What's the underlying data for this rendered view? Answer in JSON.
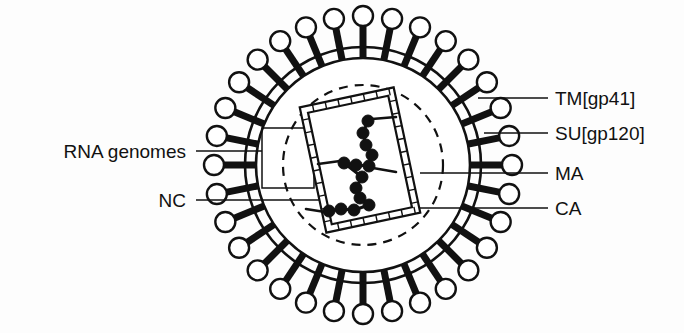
{
  "figure": {
    "kind": "hiv-virion-cross-section-diagram",
    "background_color": "#fdfdfd",
    "stroke_color": "#111111",
    "fill_color": "#ffffff"
  },
  "geometry": {
    "center_x": 363,
    "center_y": 165,
    "envelope_outer_radius": 118,
    "envelope_inner_radius": 107,
    "matrix_dashed_radius": 80,
    "spike_count": 32,
    "spike_bar_length": 22,
    "spike_head_radius": 10,
    "capsid_rotation_deg": -12,
    "capsid_x": 312,
    "capsid_y": 96,
    "capsid_width": 96,
    "capsid_height": 128,
    "capsid_wall_thickness": 7
  },
  "labels": {
    "right": [
      {
        "id": "tm",
        "text": "TM[gp41]",
        "text_x": 555,
        "text_y": 105,
        "line_x1": 478,
        "line_y1": 98,
        "line_x2": 548,
        "line_y2": 98
      },
      {
        "id": "su",
        "text": "SU[gp120]",
        "text_x": 555,
        "text_y": 140,
        "line_x1": 484,
        "line_y1": 133,
        "line_x2": 548,
        "line_y2": 133
      },
      {
        "id": "ma",
        "text": "MA",
        "text_x": 555,
        "text_y": 180,
        "line_x1": 420,
        "line_y1": 173,
        "line_x2": 548,
        "line_y2": 173
      },
      {
        "id": "ca",
        "text": "CA",
        "text_x": 555,
        "text_y": 215,
        "line_x1": 395,
        "line_y1": 208,
        "line_x2": 548,
        "line_y2": 208
      }
    ],
    "left": [
      {
        "id": "rna",
        "text": "RNA genomes",
        "text_x": 186,
        "text_y": 158,
        "line_x1": 196,
        "line_y1": 151,
        "line_x2": 262,
        "line_y2": 151
      },
      {
        "id": "nc",
        "text": "NC",
        "text_x": 186,
        "text_y": 207,
        "line_x1": 196,
        "line_y1": 200,
        "line_x2": 330,
        "line_y2": 200
      }
    ]
  },
  "rna_bracket": {
    "x": 262,
    "y": 128,
    "width": 52,
    "height": 60
  },
  "nucleocapsid_beads": [
    {
      "cx": 368,
      "cy": 121,
      "r": 6
    },
    {
      "cx": 363,
      "cy": 133,
      "r": 6
    },
    {
      "cx": 366,
      "cy": 145,
      "r": 6
    },
    {
      "cx": 372,
      "cy": 155,
      "r": 6
    },
    {
      "cx": 369,
      "cy": 166,
      "r": 6
    },
    {
      "cx": 356,
      "cy": 165,
      "r": 6
    },
    {
      "cx": 344,
      "cy": 163,
      "r": 6
    },
    {
      "cx": 362,
      "cy": 177,
      "r": 6
    },
    {
      "cx": 356,
      "cy": 188,
      "r": 6
    },
    {
      "cx": 360,
      "cy": 198,
      "r": 6
    },
    {
      "cx": 369,
      "cy": 205,
      "r": 6
    },
    {
      "cx": 354,
      "cy": 210,
      "r": 6
    },
    {
      "cx": 341,
      "cy": 209,
      "r": 6
    },
    {
      "cx": 329,
      "cy": 211,
      "r": 6
    }
  ],
  "rna_strands": [
    {
      "x1": 372,
      "y1": 119,
      "x2": 396,
      "y2": 117
    },
    {
      "x1": 340,
      "y1": 161,
      "x2": 318,
      "y2": 164
    },
    {
      "x1": 373,
      "y1": 168,
      "x2": 396,
      "y2": 172
    },
    {
      "x1": 325,
      "y1": 212,
      "x2": 306,
      "y2": 209
    }
  ]
}
